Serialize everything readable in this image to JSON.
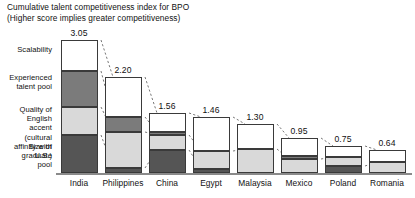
{
  "title": {
    "line1": "Cumulative talent competitiveness index for BPO",
    "line2": "(Higher score implies greater competitiveness)"
  },
  "segment_labels": [
    {
      "id": "scalability",
      "text": "Scalability",
      "color": "#ffffff"
    },
    {
      "id": "experienced-talent-pool",
      "text": "Experienced\ntalent pool",
      "color": "#7b7b7b"
    },
    {
      "id": "quality-of-english-accent",
      "text": "Quality of English\naccent (cultural\naffinity with U.S.)",
      "color": "#d9d9d9"
    },
    {
      "id": "size-of-graduate-pool",
      "text": "Size of graduate\npool",
      "color": "#555555"
    }
  ],
  "chart_data": {
    "type": "bar",
    "stacked": true,
    "title": "Cumulative talent competitiveness index for BPO",
    "subtitle": "(Higher score implies greater competitiveness)",
    "xlabel": "",
    "ylabel": "",
    "ylim": [
      0,
      3.05
    ],
    "grid": false,
    "legend": "left-labels",
    "categories": [
      "India",
      "Philippines",
      "China",
      "Egypt",
      "Malaysia",
      "Mexico",
      "Poland",
      "Romania"
    ],
    "totals": [
      3.05,
      2.2,
      1.56,
      1.46,
      1.3,
      0.95,
      0.75,
      0.64
    ],
    "total_labels": [
      "3.05",
      "2.20",
      "1.56",
      "1.46",
      "1.30",
      "0.95",
      "0.75",
      "0.64"
    ],
    "series": [
      {
        "name": "Size of graduate pool",
        "values": [
          0.87,
          0.1,
          0.6,
          0.11,
          0.0,
          0.0,
          0.15,
          0.0
        ]
      },
      {
        "name": "Quality of English accent",
        "values": [
          0.64,
          0.83,
          0.34,
          0.5,
          0.57,
          0.4,
          0.33,
          0.31
        ]
      },
      {
        "name": "Experienced talent pool",
        "values": [
          0.83,
          0.34,
          0.06,
          0.0,
          0.0,
          0.05,
          0.0,
          0.0
        ]
      },
      {
        "name": "Scalability",
        "values": [
          0.71,
          0.93,
          0.56,
          0.85,
          0.73,
          0.5,
          0.27,
          0.33
        ]
      }
    ]
  },
  "bars": [
    {
      "country": "India",
      "value_label": "3.05",
      "segments": [
        {
          "name": "scalability",
          "fill": "f-scal",
          "top": 40,
          "height": 31
        },
        {
          "name": "experienced-talent-pool",
          "fill": "f-exp",
          "top": 71,
          "height": 36
        },
        {
          "name": "quality-of-english-accent",
          "fill": "f-eng",
          "top": 107,
          "height": 28
        },
        {
          "name": "size-of-graduate-pool",
          "fill": "f-grad",
          "top": 135,
          "height": 38
        }
      ]
    },
    {
      "country": "Philippines",
      "value_label": "2.20",
      "segments": [
        {
          "name": "scalability",
          "fill": "f-scal",
          "top": 77,
          "height": 40
        },
        {
          "name": "experienced-talent-pool",
          "fill": "f-exp",
          "top": 117,
          "height": 15
        },
        {
          "name": "quality-of-english-accent",
          "fill": "f-eng",
          "top": 132,
          "height": 36
        },
        {
          "name": "size-of-graduate-pool",
          "fill": "f-grad",
          "top": 168,
          "height": 5
        }
      ]
    },
    {
      "country": "China",
      "value_label": "1.56",
      "segments": [
        {
          "name": "scalability",
          "fill": "f-scal",
          "top": 113,
          "height": 19
        },
        {
          "name": "experienced-talent-pool",
          "fill": "f-exp",
          "top": 132,
          "height": 3
        },
        {
          "name": "quality-of-english-accent",
          "fill": "f-eng",
          "top": 135,
          "height": 15
        },
        {
          "name": "size-of-graduate-pool",
          "fill": "f-grad",
          "top": 150,
          "height": 23
        }
      ]
    },
    {
      "country": "Egypt",
      "value_label": "1.46",
      "segments": [
        {
          "name": "scalability",
          "fill": "f-scal",
          "top": 117,
          "height": 34
        },
        {
          "name": "quality-of-english-accent",
          "fill": "f-eng",
          "top": 151,
          "height": 18
        },
        {
          "name": "size-of-graduate-pool",
          "fill": "f-grad",
          "top": 169,
          "height": 4
        }
      ]
    },
    {
      "country": "Malaysia",
      "value_label": "1.30",
      "segments": [
        {
          "name": "scalability",
          "fill": "f-scal",
          "top": 124,
          "height": 25
        },
        {
          "name": "quality-of-english-accent",
          "fill": "f-eng",
          "top": 149,
          "height": 24
        }
      ]
    },
    {
      "country": "Mexico",
      "value_label": "0.95",
      "segments": [
        {
          "name": "scalability",
          "fill": "f-scal",
          "top": 138,
          "height": 18
        },
        {
          "name": "experienced-talent-pool",
          "fill": "f-exp",
          "top": 156,
          "height": 3
        },
        {
          "name": "quality-of-english-accent",
          "fill": "f-eng",
          "top": 159,
          "height": 14
        }
      ]
    },
    {
      "country": "Poland",
      "value_label": "0.75",
      "segments": [
        {
          "name": "scalability",
          "fill": "f-scal",
          "top": 146,
          "height": 11
        },
        {
          "name": "quality-of-english-accent",
          "fill": "f-eng",
          "top": 157,
          "height": 9
        },
        {
          "name": "size-of-graduate-pool",
          "fill": "f-grad",
          "top": 166,
          "height": 7
        }
      ]
    },
    {
      "country": "Romania",
      "value_label": "0.64",
      "segments": [
        {
          "name": "scalability",
          "fill": "f-scal",
          "top": 150,
          "height": 12
        },
        {
          "name": "quality-of-english-accent",
          "fill": "f-eng",
          "top": 162,
          "height": 11
        }
      ]
    }
  ]
}
